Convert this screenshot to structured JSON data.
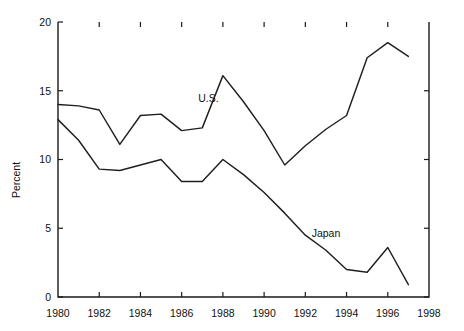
{
  "chart_data": {
    "type": "line",
    "title": "",
    "subtitle": "",
    "xlabel": "",
    "ylabel": "Percent",
    "xlim": [
      1980,
      1998
    ],
    "ylim": [
      0,
      20
    ],
    "grid": false,
    "legend_position": "inline-annotation",
    "x_ticks": [
      1980,
      1982,
      1984,
      1986,
      1988,
      1990,
      1992,
      1994,
      1996,
      1998
    ],
    "x_tick_labels": [
      "1980",
      "1982",
      "1984",
      "1986",
      "1988",
      "1990",
      "1992",
      "1994",
      "1996",
      "1998"
    ],
    "y_ticks": [
      0,
      5,
      10,
      15,
      20
    ],
    "y_tick_labels": [
      "0",
      "5",
      "10",
      "15",
      "20"
    ],
    "x": [
      1980,
      1981,
      1982,
      1983,
      1984,
      1985,
      1986,
      1987,
      1988,
      1989,
      1990,
      1991,
      1992,
      1993,
      1994,
      1995,
      1996,
      1997
    ],
    "series": [
      {
        "name": "U.S.",
        "color": "#1f1f1f",
        "label_x": 1987.3,
        "label_y": 14.2,
        "values": [
          14.0,
          13.9,
          13.6,
          11.1,
          13.2,
          13.3,
          12.1,
          12.3,
          16.1,
          14.2,
          12.1,
          9.6,
          11.0,
          12.2,
          13.2,
          17.4,
          18.5,
          17.5
        ]
      },
      {
        "name": "Japan",
        "color": "#1f1f1f",
        "label_x": 1993.0,
        "label_y": 4.4,
        "values": [
          12.9,
          11.4,
          9.3,
          9.2,
          9.6,
          10.0,
          8.4,
          8.4,
          10.0,
          8.9,
          7.6,
          6.1,
          4.5,
          3.4,
          2.0,
          1.8,
          3.6,
          0.9
        ]
      }
    ]
  }
}
